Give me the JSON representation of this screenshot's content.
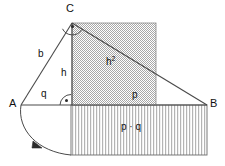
{
  "figure": {
    "width": 225,
    "height": 166,
    "background_color": "#ffffff",
    "line_color": "#4a4a4a",
    "text_color": "#111111",
    "square_fill_color": "#c9c9c9",
    "rect_stripe_color": "#bdbdbd"
  },
  "vertices": [
    {
      "name": "A",
      "label": "A",
      "x": 21,
      "y": 105,
      "label_x": 9,
      "label_y": 99
    },
    {
      "name": "B",
      "label": "B",
      "x": 207,
      "y": 105,
      "label_x": 210,
      "label_y": 99
    },
    {
      "name": "C",
      "label": "C",
      "x": 72,
      "y": 23,
      "label_x": 66,
      "label_y": 4
    }
  ],
  "segments": {
    "hypotenuse_AB": {
      "label": "A-B",
      "x1": 21,
      "y1": 105,
      "x2": 207,
      "y2": 105
    },
    "side_b_AC": {
      "label": "b",
      "x1": 21,
      "y1": 105,
      "x2": 72,
      "y2": 23
    },
    "side_a_CB": {
      "label": "a",
      "x1": 72,
      "y1": 23,
      "x2": 207,
      "y2": 105
    },
    "altitude_h": {
      "label": "h",
      "x1": 72,
      "y1": 23,
      "x2": 72,
      "y2": 105
    }
  },
  "labels": {
    "b": {
      "text": "b",
      "x": 38,
      "y": 50
    },
    "h": {
      "text": "h",
      "x": 61,
      "y": 69
    },
    "q": {
      "text": "q",
      "x": 41,
      "y": 90
    },
    "p": {
      "text": "p",
      "x": 132,
      "y": 91
    },
    "h_squared": {
      "text": "h",
      "exponent": "2",
      "x": 106,
      "y": 56
    },
    "p_times_q": {
      "text": "p · q",
      "x": 121,
      "y": 123
    }
  },
  "shapes": {
    "square_on_h": {
      "name": "h-squared-square",
      "x": 72,
      "y": 23,
      "width": 84,
      "height": 82,
      "fill": "checkerboard-gray",
      "label": "h²"
    },
    "rectangle_pq": {
      "name": "p-times-q-rectangle",
      "x": 71,
      "y": 105,
      "width": 136,
      "height": 50,
      "fill": "vertical-stripes",
      "label": "p · q"
    }
  },
  "markers": {
    "right_angle_at_C": {
      "name": "right-angle-marker-c",
      "cx": 72,
      "cy": 23,
      "radius": 10,
      "dot": true
    },
    "right_angle_at_foot": {
      "name": "right-angle-marker-foot",
      "cx": 71,
      "cy": 105,
      "radius": 10,
      "dot": true
    },
    "angle_arc_q": {
      "name": "angle-arc-alpha",
      "cx": 21,
      "cy": 105,
      "radius": 0,
      "dot": false
    }
  },
  "rotation_arc": {
    "name": "rotation-arc-arrow",
    "from_x": 21,
    "from_y": 105,
    "to_x": 71,
    "to_y": 155,
    "arrow_x": 38,
    "arrow_y": 144,
    "description": "arc with arrowhead from A sweeping down to bottom-left of rectangle"
  }
}
